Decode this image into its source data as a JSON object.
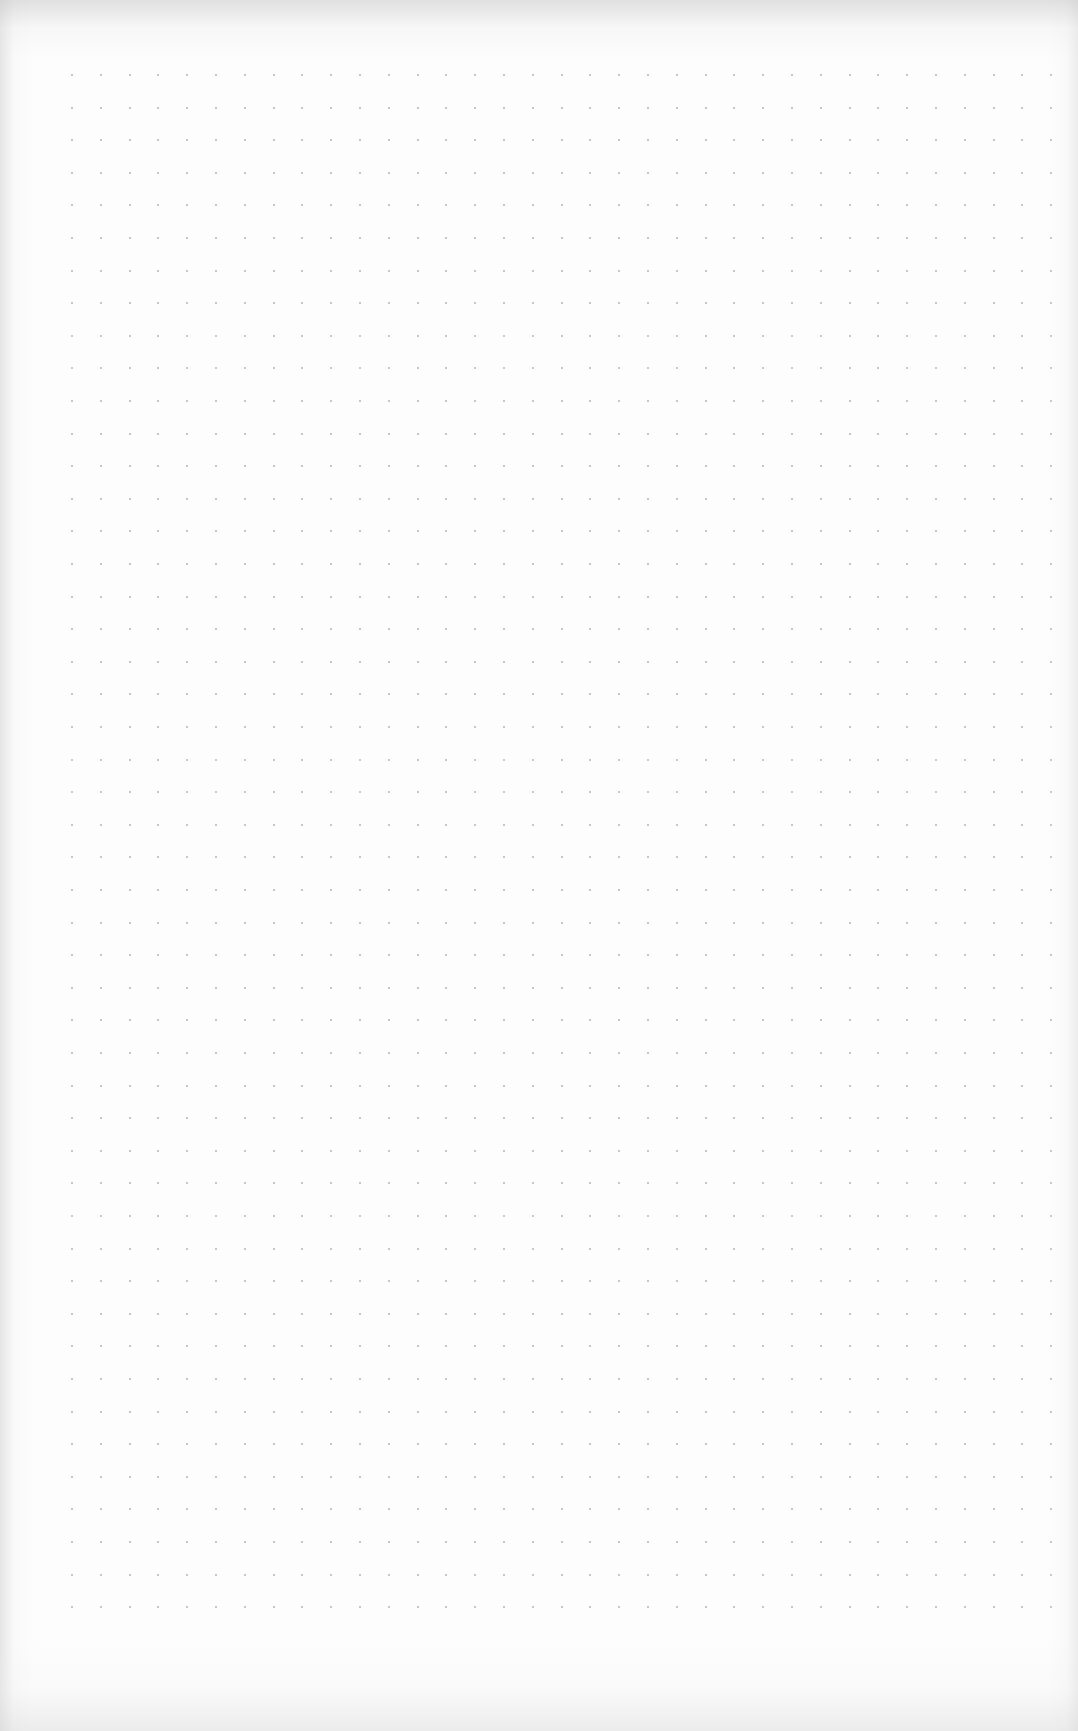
{
  "page": {
    "type": "dot-grid paper sheet",
    "background_color": "#fdfdfd",
    "edge_shadow_color": "#c8c8c8"
  },
  "grid": {
    "dot_color": "#b4b4b4",
    "dot_size_px": 2,
    "origin_x": 72,
    "origin_y": 75,
    "spacing_x": 28.8,
    "spacing_y": 32.6,
    "columns": 35,
    "rows": 48
  }
}
